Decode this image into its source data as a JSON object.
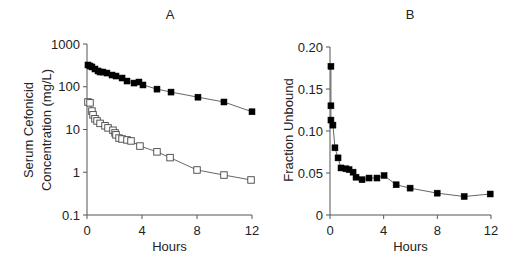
{
  "chart_data": [
    {
      "panel": "A",
      "type": "line",
      "title": "A",
      "xlabel": "Hours",
      "ylabel_lines": [
        "Serum Cefonicid",
        "Concentration (mg/L)"
      ],
      "yscale": "log",
      "xlim": [
        0,
        12
      ],
      "ylim": [
        0.1,
        1000
      ],
      "xticks": [
        0,
        4,
        8,
        12
      ],
      "xtick_labels": [
        "0",
        "4",
        "8",
        "12"
      ],
      "yticks": [
        0.1,
        1,
        10,
        100,
        1000
      ],
      "ytick_labels": [
        "0.1",
        "1",
        "10",
        "100",
        "1000"
      ],
      "grid": false,
      "legend": null,
      "series": [
        {
          "name": "Total (filled squares)",
          "marker": "filled-square",
          "x": [
            0.07,
            0.22,
            0.36,
            0.58,
            0.8,
            0.95,
            1.16,
            1.45,
            1.82,
            2.11,
            2.55,
            2.91,
            3.42,
            3.78,
            4.07,
            5.09,
            6.11,
            8.07,
            9.96,
            12.0
          ],
          "values": [
            323,
            306,
            290,
            260,
            234,
            221,
            221,
            209,
            188,
            178,
            160,
            136,
            122,
            129,
            110,
            88,
            75,
            57,
            44,
            26
          ]
        },
        {
          "name": "Unbound (open squares)",
          "marker": "open-square",
          "x": [
            0.07,
            0.22,
            0.36,
            0.44,
            0.58,
            0.73,
            0.95,
            1.31,
            1.53,
            1.89,
            2.04,
            2.11,
            2.33,
            2.55,
            2.91,
            3.2,
            3.85,
            5.09,
            6.04,
            8.0,
            9.96,
            11.93
          ],
          "values": [
            44,
            42,
            27,
            22,
            17.8,
            15.9,
            13.9,
            12.2,
            10.9,
            9.6,
            8.3,
            7.5,
            6.3,
            6.0,
            5.7,
            5.4,
            4.1,
            3.0,
            2.2,
            1.13,
            0.86,
            0.66
          ]
        }
      ]
    },
    {
      "panel": "B",
      "type": "line",
      "title": "B",
      "xlabel": "Hours",
      "ylabel": "Fraction Unbound",
      "xlim": [
        0,
        12
      ],
      "ylim": [
        0,
        0.2
      ],
      "xticks": [
        0,
        4,
        8,
        12
      ],
      "xtick_labels": [
        "0",
        "4",
        "8",
        "12"
      ],
      "yticks": [
        0,
        0.05,
        0.1,
        0.15,
        0.2
      ],
      "ytick_labels": [
        "0",
        "0.05",
        "0.10",
        "0.15",
        "0.20"
      ],
      "grid": false,
      "legend": null,
      "series": [
        {
          "name": "Fraction Unbound",
          "marker": "filled-square",
          "x": [
            0.07,
            0.07,
            0.07,
            0.22,
            0.37,
            0.6,
            0.82,
            1.19,
            1.42,
            1.72,
            1.94,
            2.39,
            2.91,
            3.5,
            4.03,
            4.93,
            5.97,
            7.99,
            10.0,
            11.94
          ],
          "values": [
            0.177,
            0.13,
            0.113,
            0.107,
            0.08,
            0.068,
            0.056,
            0.055,
            0.054,
            0.051,
            0.045,
            0.042,
            0.044,
            0.044,
            0.047,
            0.036,
            0.032,
            0.026,
            0.022,
            0.025
          ]
        }
      ]
    }
  ]
}
